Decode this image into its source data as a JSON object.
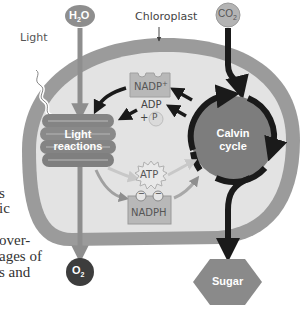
{
  "diagram": {
    "title_label": "Chloroplast",
    "light_label": "Light",
    "inputs": {
      "water": "H",
      "water_sub": "2",
      "water_end": "O",
      "carbon_dioxide": "CO",
      "carbon_dioxide_sub": "2"
    },
    "outputs": {
      "oxygen": "O",
      "oxygen_sub": "2",
      "sugar": "Sugar"
    },
    "stages": {
      "light_reactions_line1": "Light",
      "light_reactions_line2": "reactions",
      "calvin_cycle_line1": "Calvin",
      "calvin_cycle_line2": "cycle"
    },
    "carriers": {
      "nadp": "NADP",
      "nadp_sup": "+",
      "adp": "ADP",
      "plus": "+",
      "phosphate": "P",
      "atp": "ATP",
      "nadph": "NADPH",
      "electron_sign": "−"
    },
    "colors": {
      "membrane": "#9b9b9b",
      "stroma": "#e3e3e3",
      "dark_circle": "#3d3d3d",
      "calvin": "#7d7d7d",
      "arrow": "#1a1a1a",
      "light_gray_node": "#b4b4b4"
    }
  },
  "page_text_fragments": [
    "s",
    "ic",
    "over-",
    "ages of",
    "s and"
  ]
}
